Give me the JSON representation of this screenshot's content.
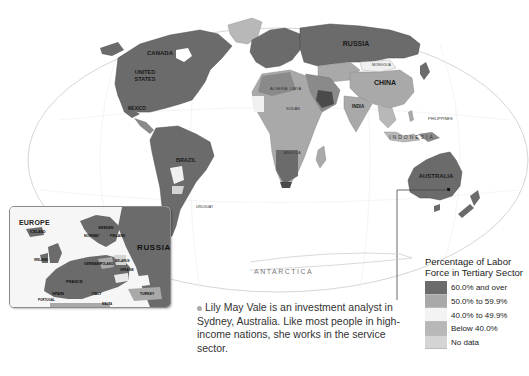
{
  "map": {
    "type": "choropleth world map",
    "ocean_labels": {
      "antarctica": "ANTARCTICA"
    },
    "country_labels": {
      "canada": "CANADA",
      "united_states": "UNITED STATES",
      "mexico": "MEXICO",
      "brazil": "BRAZIL",
      "russia": "RUSSIA",
      "china": "CHINA",
      "india": "INDIA",
      "australia": "AUSTRALIA",
      "indonesia": "INDONESIA",
      "algeria": "ALGERIA",
      "libya": "LIBYA",
      "egypt": "EGYPT",
      "sudan": "SUDAN",
      "angola": "ANGOLA",
      "philippines": "PHILIPPINES",
      "mongolia": "MONGOLIA",
      "kazakhstan": "KAZAKHSTAN",
      "saudi_arabia": "SAUDI ARABIA",
      "argentina": "ARGENTINA",
      "uruguay": "URUGUAY",
      "chile": "CHILE"
    }
  },
  "inset": {
    "title": "EUROPE",
    "labels": {
      "russia": "RUSSIA",
      "iceland": "ICELAND",
      "norway": "NORWAY",
      "sweden": "SWEDEN",
      "finland": "FINLAND",
      "ireland": "IRELAND",
      "united_kingdom": "UNITED KINGDOM",
      "denmark": "DENMARK",
      "germany": "GERMANY",
      "poland": "POLAND",
      "belarus": "BELARUS",
      "ukraine": "UKRAINE",
      "france": "FRANCE",
      "spain": "SPAIN",
      "portugal": "PORTUGAL",
      "italy": "ITALY",
      "turkey": "TURKEY",
      "romania": "ROMANIA",
      "moldova": "MOLDOVA",
      "malta": "MALTA"
    }
  },
  "caption": {
    "text": "Lily May Vale is an investment analyst in Sydney, Australia. Like most people in high-income nations, she works in the service sector."
  },
  "legend": {
    "title_line1": "Percentage of Labor",
    "title_line2": "Force in Tertiary Sector",
    "items": [
      {
        "label": "60.0% and over",
        "color": "#6b6b6b"
      },
      {
        "label": "50.0% to 59.9%",
        "color": "#a9a9a9"
      },
      {
        "label": "40.0% to 49.9%",
        "color": "#f3f3f3"
      },
      {
        "label": "Below 40.0%",
        "color": "#b8b8b8"
      },
      {
        "label": "No data",
        "color": "#d4d4d4"
      }
    ]
  }
}
